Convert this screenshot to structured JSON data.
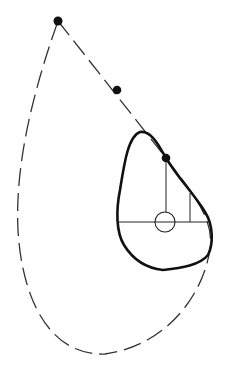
{
  "diagram": {
    "title": "",
    "colors": {
      "background": "#ffffff",
      "stroke": "#111111",
      "dash": "#333333"
    },
    "points": [
      {
        "id": "apex",
        "x": 58,
        "y": 21
      },
      {
        "id": "mid",
        "x": 117,
        "y": 90
      },
      {
        "id": "contact",
        "x": 166,
        "y": 158
      }
    ],
    "inner_circle": {
      "cx": 165,
      "cy": 222,
      "r": 10
    },
    "horizontal_line": {
      "x1": 119,
      "y1": 222,
      "x2": 211,
      "y2": 222
    },
    "vertical_line": {
      "x1": 166,
      "y1": 158,
      "x2": 166,
      "y2": 222
    },
    "short_vertical_line": {
      "x1": 190,
      "y1": 193,
      "x2": 190,
      "y2": 222
    }
  }
}
